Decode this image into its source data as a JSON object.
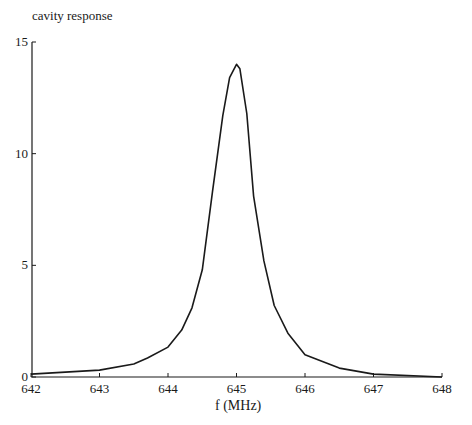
{
  "chart_data": {
    "type": "line",
    "title": "",
    "xlabel": "f (MHz)",
    "ylabel": "cavity response",
    "xlim": [
      642,
      648
    ],
    "ylim": [
      0,
      15
    ],
    "xticks": [
      642,
      643,
      644,
      645,
      646,
      647,
      648
    ],
    "yticks": [
      0,
      5,
      10,
      15
    ],
    "grid": false,
    "legend": null,
    "series": [
      {
        "name": "cavity response",
        "color": "#1a1a1a",
        "x": [
          642.0,
          643.0,
          643.5,
          643.7,
          644.0,
          644.2,
          644.35,
          644.5,
          644.65,
          644.8,
          644.9,
          645.0,
          645.05,
          645.15,
          645.25,
          645.4,
          645.55,
          645.75,
          646.0,
          646.5,
          647.0,
          648.0
        ],
        "y": [
          0.13,
          0.31,
          0.58,
          0.85,
          1.34,
          2.1,
          3.1,
          4.8,
          8.3,
          11.7,
          13.4,
          14.0,
          13.8,
          11.8,
          8.1,
          5.2,
          3.2,
          1.96,
          1.0,
          0.4,
          0.13,
          0.0
        ]
      }
    ]
  },
  "labels": {
    "ylabel": "cavity response",
    "xlabel": "f (MHz)"
  }
}
